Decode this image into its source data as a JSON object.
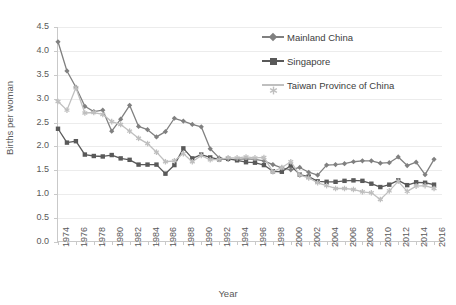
{
  "chart_data": {
    "type": "line",
    "title": "",
    "xlabel": "Year",
    "ylabel": "Births per woman",
    "xlim": [
      1974,
      2017
    ],
    "ylim": [
      0.0,
      4.5
    ],
    "ytick_step": 0.5,
    "grid": true,
    "legend_position": "top-right",
    "ytick_labels": [
      "4.5",
      "4.0",
      "3.5",
      "3.0",
      "2.5",
      "2.0",
      "1.5",
      "1.0",
      "0.5",
      "0.0"
    ],
    "ytick_values": [
      4.5,
      4.0,
      3.5,
      3.0,
      2.5,
      2.0,
      1.5,
      1.0,
      0.5,
      0.0
    ],
    "xtick_labels": [
      "1974",
      "1976",
      "1978",
      "1980",
      "1982",
      "1984",
      "1986",
      "1988",
      "1990",
      "1992",
      "1994",
      "1996",
      "1998",
      "2000",
      "2002",
      "2004",
      "2006",
      "2008",
      "2010",
      "2012",
      "2014",
      "2016"
    ],
    "x": [
      1974,
      1975,
      1976,
      1977,
      1978,
      1979,
      1980,
      1981,
      1982,
      1983,
      1984,
      1985,
      1986,
      1987,
      1988,
      1989,
      1990,
      1991,
      1992,
      1993,
      1994,
      1995,
      1996,
      1997,
      1998,
      1999,
      2000,
      2001,
      2002,
      2003,
      2004,
      2005,
      2006,
      2007,
      2008,
      2009,
      2010,
      2011,
      2012,
      2013,
      2014,
      2015,
      2016
    ],
    "series": [
      {
        "name": "Mainland China",
        "color": "#808080",
        "marker": "diamond",
        "values": [
          4.19,
          3.58,
          3.24,
          2.84,
          2.73,
          2.76,
          2.32,
          2.57,
          2.86,
          2.42,
          2.35,
          2.2,
          2.31,
          2.59,
          2.53,
          2.46,
          2.41,
          1.95,
          1.76,
          1.73,
          1.73,
          1.74,
          1.73,
          1.7,
          1.62,
          1.55,
          1.51,
          1.56,
          1.46,
          1.4,
          1.61,
          1.62,
          1.64,
          1.68,
          1.7,
          1.7,
          1.65,
          1.66,
          1.78,
          1.6,
          1.67,
          1.41,
          1.73
        ]
      },
      {
        "name": "Singapore",
        "color": "#595959",
        "marker": "square",
        "values": [
          2.37,
          2.08,
          2.11,
          1.83,
          1.8,
          1.79,
          1.82,
          1.75,
          1.72,
          1.62,
          1.62,
          1.62,
          1.43,
          1.61,
          1.96,
          1.75,
          1.83,
          1.77,
          1.73,
          1.74,
          1.71,
          1.67,
          1.66,
          1.61,
          1.48,
          1.47,
          1.6,
          1.41,
          1.37,
          1.27,
          1.26,
          1.26,
          1.28,
          1.29,
          1.28,
          1.22,
          1.15,
          1.2,
          1.29,
          1.19,
          1.25,
          1.24,
          1.2
        ]
      },
      {
        "name": "Taiwan Province of China",
        "color": "#bfbfbf",
        "marker": "star",
        "values": [
          2.94,
          2.76,
          3.23,
          2.7,
          2.71,
          2.67,
          2.52,
          2.46,
          2.32,
          2.17,
          2.06,
          1.88,
          1.68,
          1.7,
          1.85,
          1.68,
          1.81,
          1.72,
          1.73,
          1.76,
          1.76,
          1.78,
          1.76,
          1.77,
          1.47,
          1.56,
          1.68,
          1.4,
          1.34,
          1.24,
          1.18,
          1.12,
          1.12,
          1.1,
          1.05,
          1.03,
          0.89,
          1.07,
          1.27,
          1.06,
          1.17,
          1.18,
          1.12
        ]
      }
    ]
  }
}
